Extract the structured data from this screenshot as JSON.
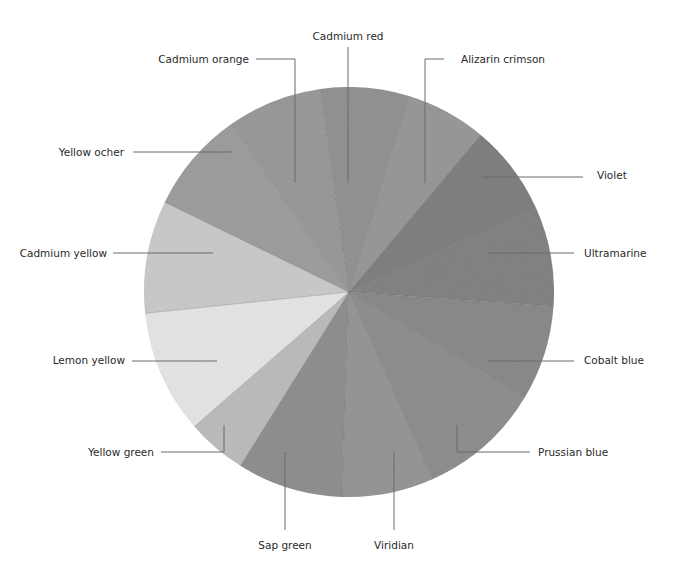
{
  "diagram": {
    "type": "color-wheel",
    "center": [
      349,
      292
    ],
    "radius": 205,
    "start_angle_deg": -8,
    "segments": [
      {
        "name": "Cadmium red",
        "start": -8,
        "end": 17,
        "fill": "#8e8e8e"
      },
      {
        "name": "Alizarin crimson",
        "start": 17,
        "end": 40,
        "fill": "#949494"
      },
      {
        "name": "Violet",
        "start": 40,
        "end": 66,
        "fill": "#7a7a7a"
      },
      {
        "name": "Ultramarine",
        "start": 66,
        "end": 94,
        "fill": "#7e7e7e"
      },
      {
        "name": "Cobalt blue",
        "start": 94,
        "end": 121,
        "fill": "#858585"
      },
      {
        "name": "Prussian blue",
        "start": 121,
        "end": 156,
        "fill": "#8a8a8a"
      },
      {
        "name": "Viridian",
        "start": 156,
        "end": 182,
        "fill": "#929292"
      },
      {
        "name": "Sap green",
        "start": 182,
        "end": 212,
        "fill": "#8b8b8b"
      },
      {
        "name": "Yellow green",
        "start": 212,
        "end": 229,
        "fill": "#b9b9b9"
      },
      {
        "name": "Lemon yellow",
        "start": 229,
        "end": 264,
        "fill": "#e3e3e3"
      },
      {
        "name": "Cadmium yellow",
        "start": 264,
        "end": 296,
        "fill": "#c7c7c7"
      },
      {
        "name": "Yellow ocher",
        "start": 296,
        "end": 325,
        "fill": "#9a9a9a"
      },
      {
        "name": "Cadmium orange",
        "start": 325,
        "end": 352,
        "fill": "#959595"
      }
    ]
  },
  "labels": [
    {
      "id": "cadmium-red",
      "text": "Cadmium red",
      "x": 348,
      "y": 30,
      "align": "center",
      "leader": [
        [
          348,
          47
        ],
        [
          348,
          183
        ]
      ]
    },
    {
      "id": "cadmium-orange",
      "text": "Cadmium orange",
      "x": 249,
      "y": 53,
      "align": "right",
      "leader": [
        [
          256,
          59
        ],
        [
          295,
          59
        ],
        [
          295,
          183
        ]
      ]
    },
    {
      "id": "alizarin-crimson",
      "text": "Alizarin crimson",
      "x": 461,
      "y": 53,
      "align": "left",
      "leader": [
        [
          444,
          59
        ],
        [
          425,
          59
        ],
        [
          425,
          183
        ]
      ]
    },
    {
      "id": "yellow-ocher",
      "text": "Yellow ocher",
      "x": 124,
      "y": 146,
      "align": "right",
      "leader": [
        [
          133,
          152
        ],
        [
          232,
          152
        ]
      ]
    },
    {
      "id": "violet",
      "text": "Violet",
      "x": 597,
      "y": 169,
      "align": "left",
      "leader": [
        [
          483,
          177
        ],
        [
          583,
          177
        ]
      ]
    },
    {
      "id": "cadmium-yellow",
      "text": "Cadmium yellow",
      "x": 107,
      "y": 247,
      "align": "right",
      "leader": [
        [
          113,
          253
        ],
        [
          213,
          253
        ]
      ]
    },
    {
      "id": "ultramarine",
      "text": "Ultramarine",
      "x": 584,
      "y": 247,
      "align": "left",
      "leader": [
        [
          488,
          253
        ],
        [
          574,
          253
        ]
      ]
    },
    {
      "id": "lemon-yellow",
      "text": "Lemon yellow",
      "x": 125,
      "y": 354,
      "align": "right",
      "leader": [
        [
          132,
          361
        ],
        [
          217,
          361
        ]
      ]
    },
    {
      "id": "cobalt-blue",
      "text": "Cobalt blue",
      "x": 584,
      "y": 354,
      "align": "left",
      "leader": [
        [
          488,
          361
        ],
        [
          574,
          361
        ]
      ]
    },
    {
      "id": "yellow-green",
      "text": "Yellow green",
      "x": 154,
      "y": 446,
      "align": "right",
      "leader": [
        [
          161,
          452
        ],
        [
          224,
          452
        ],
        [
          224,
          425
        ]
      ]
    },
    {
      "id": "prussian-blue",
      "text": "Prussian blue",
      "x": 538,
      "y": 446,
      "align": "left",
      "leader": [
        [
          457,
          425
        ],
        [
          457,
          452
        ],
        [
          530,
          452
        ]
      ]
    },
    {
      "id": "sap-green",
      "text": "Sap green",
      "x": 285,
      "y": 539,
      "align": "center",
      "leader": [
        [
          285,
          452
        ],
        [
          285,
          530
        ]
      ]
    },
    {
      "id": "viridian",
      "text": "Viridian",
      "x": 394,
      "y": 539,
      "align": "center",
      "leader": [
        [
          394,
          452
        ],
        [
          394,
          530
        ]
      ]
    }
  ]
}
